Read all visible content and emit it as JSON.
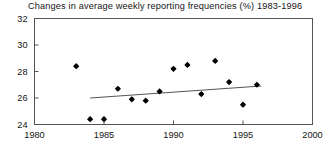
{
  "chart_data": {
    "type": "scatter",
    "title": "Changes in average weekly reporting frequencies (%) 1983-1996",
    "xlabel": "",
    "ylabel": "",
    "xlim": [
      1980,
      2000
    ],
    "ylim": [
      24,
      32
    ],
    "xticks": [
      1980,
      1985,
      1990,
      1995,
      2000
    ],
    "xtick_labels": [
      "1980",
      "1985",
      "1990",
      "1995",
      "2000"
    ],
    "yticks": [
      24,
      26,
      28,
      30,
      32
    ],
    "ytick_labels": [
      "24",
      "26",
      "28",
      "30",
      "32"
    ],
    "grid": false,
    "legend": null,
    "marker": "filled-diamond",
    "marker_color": "#000000",
    "points": [
      {
        "x": 1983.0,
        "y": 28.4
      },
      {
        "x": 1984.0,
        "y": 24.4
      },
      {
        "x": 1985.0,
        "y": 24.4
      },
      {
        "x": 1986.0,
        "y": 26.7
      },
      {
        "x": 1987.0,
        "y": 25.9
      },
      {
        "x": 1988.0,
        "y": 25.8
      },
      {
        "x": 1989.0,
        "y": 26.5
      },
      {
        "x": 1990.0,
        "y": 28.2
      },
      {
        "x": 1991.0,
        "y": 28.5
      },
      {
        "x": 1992.0,
        "y": 26.3
      },
      {
        "x": 1993.0,
        "y": 28.8
      },
      {
        "x": 1994.0,
        "y": 27.2
      },
      {
        "x": 1995.0,
        "y": 25.5
      },
      {
        "x": 1996.0,
        "y": 27.0
      }
    ],
    "trendline": {
      "type": "linear-fit",
      "color": "#555555",
      "x_start": 1984.0,
      "y_start": 26.0,
      "x_end": 1996.3,
      "y_end": 26.9
    }
  }
}
